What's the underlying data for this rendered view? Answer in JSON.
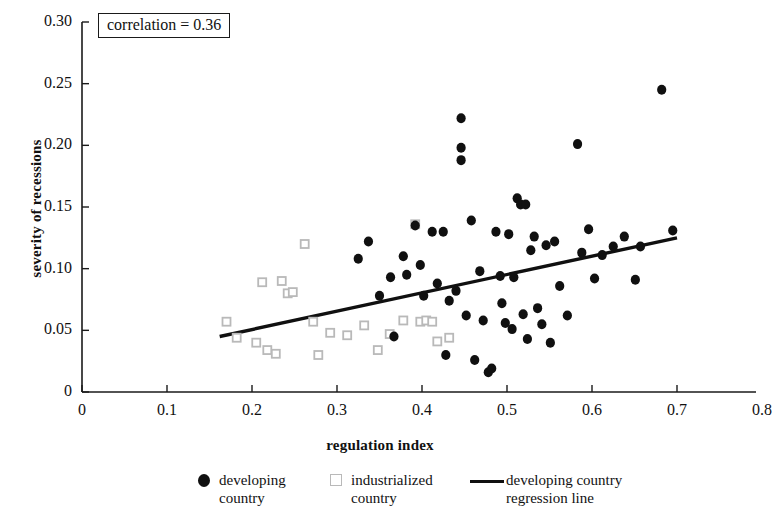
{
  "chart_data": {
    "type": "scatter",
    "title": "",
    "xlabel": "regulation index",
    "ylabel": "severity of recessions",
    "xlim": [
      0,
      0.8
    ],
    "ylim": [
      0,
      0.3
    ],
    "xticks": [
      "0",
      "0.1",
      "0.2",
      "0.3",
      "0.4",
      "0.5",
      "0.6",
      "0.7",
      "0.8"
    ],
    "xtick_values": [
      0,
      0.1,
      0.2,
      0.3,
      0.4,
      0.5,
      0.6,
      0.7,
      0.8
    ],
    "yticks": [
      "0",
      "0.05",
      "0.10",
      "0.15",
      "0.20",
      "0.25",
      "0.30"
    ],
    "ytick_values": [
      0,
      0.05,
      0.1,
      0.15,
      0.2,
      0.25,
      0.3
    ],
    "grid": false,
    "annotation": "correlation = 0.36",
    "legend_position": "below-axis",
    "series": [
      {
        "name": "developing country",
        "marker": "filled-circle",
        "color": "#101010",
        "points": [
          [
            0.325,
            0.108
          ],
          [
            0.337,
            0.122
          ],
          [
            0.35,
            0.078
          ],
          [
            0.363,
            0.093
          ],
          [
            0.367,
            0.045
          ],
          [
            0.378,
            0.11
          ],
          [
            0.382,
            0.095
          ],
          [
            0.392,
            0.135
          ],
          [
            0.398,
            0.103
          ],
          [
            0.402,
            0.078
          ],
          [
            0.412,
            0.13
          ],
          [
            0.418,
            0.088
          ],
          [
            0.425,
            0.13
          ],
          [
            0.428,
            0.03
          ],
          [
            0.432,
            0.074
          ],
          [
            0.44,
            0.082
          ],
          [
            0.446,
            0.222
          ],
          [
            0.446,
            0.198
          ],
          [
            0.446,
            0.188
          ],
          [
            0.452,
            0.062
          ],
          [
            0.458,
            0.139
          ],
          [
            0.462,
            0.026
          ],
          [
            0.468,
            0.098
          ],
          [
            0.472,
            0.058
          ],
          [
            0.478,
            0.016
          ],
          [
            0.482,
            0.019
          ],
          [
            0.487,
            0.13
          ],
          [
            0.492,
            0.094
          ],
          [
            0.494,
            0.072
          ],
          [
            0.498,
            0.056
          ],
          [
            0.502,
            0.128
          ],
          [
            0.506,
            0.051
          ],
          [
            0.508,
            0.093
          ],
          [
            0.512,
            0.157
          ],
          [
            0.516,
            0.152
          ],
          [
            0.519,
            0.063
          ],
          [
            0.522,
            0.152
          ],
          [
            0.524,
            0.043
          ],
          [
            0.528,
            0.115
          ],
          [
            0.532,
            0.126
          ],
          [
            0.536,
            0.068
          ],
          [
            0.541,
            0.055
          ],
          [
            0.546,
            0.119
          ],
          [
            0.551,
            0.04
          ],
          [
            0.556,
            0.122
          ],
          [
            0.562,
            0.086
          ],
          [
            0.571,
            0.062
          ],
          [
            0.583,
            0.201
          ],
          [
            0.588,
            0.113
          ],
          [
            0.596,
            0.132
          ],
          [
            0.603,
            0.092
          ],
          [
            0.612,
            0.111
          ],
          [
            0.625,
            0.118
          ],
          [
            0.638,
            0.126
          ],
          [
            0.651,
            0.091
          ],
          [
            0.657,
            0.118
          ],
          [
            0.682,
            0.245
          ],
          [
            0.695,
            0.131
          ]
        ]
      },
      {
        "name": "industrialized country",
        "marker": "open-square",
        "color": "#b9b9b9",
        "points": [
          [
            0.17,
            0.057
          ],
          [
            0.182,
            0.044
          ],
          [
            0.205,
            0.04
          ],
          [
            0.212,
            0.089
          ],
          [
            0.218,
            0.034
          ],
          [
            0.228,
            0.031
          ],
          [
            0.235,
            0.09
          ],
          [
            0.242,
            0.08
          ],
          [
            0.248,
            0.081
          ],
          [
            0.262,
            0.12
          ],
          [
            0.272,
            0.057
          ],
          [
            0.278,
            0.03
          ],
          [
            0.292,
            0.048
          ],
          [
            0.312,
            0.046
          ],
          [
            0.332,
            0.054
          ],
          [
            0.348,
            0.034
          ],
          [
            0.362,
            0.047
          ],
          [
            0.378,
            0.058
          ],
          [
            0.392,
            0.136
          ],
          [
            0.398,
            0.057
          ],
          [
            0.405,
            0.058
          ],
          [
            0.412,
            0.057
          ],
          [
            0.418,
            0.041
          ],
          [
            0.432,
            0.044
          ]
        ]
      }
    ],
    "regression_line": {
      "name": "developing country regression line",
      "color": "#101010",
      "x_start": 0.162,
      "y_start": 0.045,
      "x_end": 0.7,
      "y_end": 0.125
    }
  },
  "legend": {
    "items": [
      {
        "label": "developing\ncountry",
        "marker": "filled-circle"
      },
      {
        "label": "industrialized\ncountry",
        "marker": "open-square"
      },
      {
        "label": "developing country\nregression line",
        "marker": "line"
      }
    ]
  }
}
